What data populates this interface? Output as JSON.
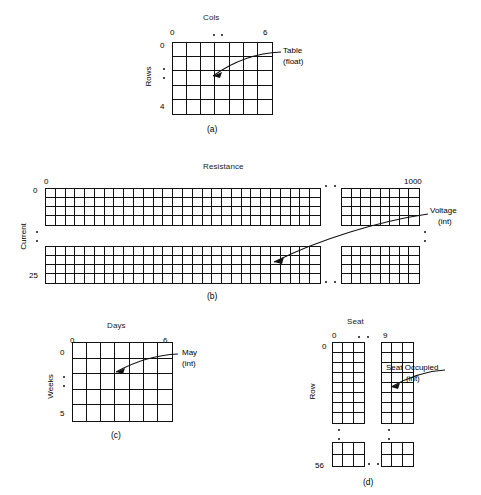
{
  "figure": {
    "panels": [
      {
        "id": "a",
        "caption": "(a)",
        "x_axis_title": "Cols",
        "x_min": "0",
        "x_max": "6",
        "y_axis_title": "Rows",
        "y_min": "0",
        "y_max": "4",
        "annotation_line1": "Table",
        "annotation_line2": "(float)",
        "cols": 7,
        "rows": 5,
        "split": "none"
      },
      {
        "id": "b",
        "caption": "(b)",
        "x_axis_title": "Resistance",
        "x_min": "0",
        "x_max": "1000",
        "y_axis_title": "Current",
        "y_min": "0",
        "y_max": "25",
        "annotation_line1": "Voltage",
        "annotation_line2": "(int)",
        "cols": 28,
        "rows": 4,
        "split": "both"
      },
      {
        "id": "c",
        "caption": "(c)",
        "x_axis_title": "Days",
        "x_min": "0",
        "x_max": "6",
        "y_axis_title": "Weeks",
        "y_min": "0",
        "y_max": "5",
        "annotation_line1": "May",
        "annotation_line2": "(int)",
        "cols": 7,
        "rows": 5,
        "split": "none"
      },
      {
        "id": "d",
        "caption": "(d)",
        "x_axis_title": "Seat",
        "x_min": "0",
        "x_max": "9",
        "y_axis_title": "Row",
        "y_min": "0",
        "y_max": "56",
        "annotation_line1": "Seat Occupied",
        "annotation_line2": "(int)",
        "cols": 3,
        "rows": 8,
        "split": "both"
      }
    ]
  },
  "colors": {
    "ink": "#111111",
    "background": "#ffffff"
  }
}
